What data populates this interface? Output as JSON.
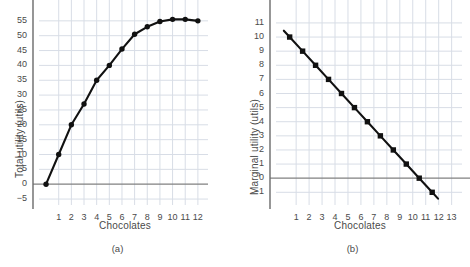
{
  "figure": {
    "panels": [
      {
        "caption": "(a)",
        "xlabel": "Chocolates",
        "ylabel": "Total utility (utils)"
      },
      {
        "caption": "(b)",
        "xlabel": "Chocolates",
        "ylabel": "Marginal utility (utils)"
      }
    ]
  },
  "chart_data": [
    {
      "type": "line",
      "title": "",
      "subtitle": "(a)",
      "xlabel": "Chocolates",
      "ylabel": "Total utility (utils)",
      "x": [
        0,
        1,
        2,
        3,
        4,
        5,
        6,
        7,
        8,
        9,
        10,
        11,
        12
      ],
      "values": [
        0,
        10,
        20,
        27,
        35,
        40,
        45.5,
        50.5,
        53,
        54.8,
        55.5,
        55.5,
        55
      ],
      "xlim": [
        -0.4,
        12.8
      ],
      "ylim": [
        -7,
        60
      ],
      "xticks": [
        1,
        2,
        3,
        4,
        5,
        6,
        7,
        8,
        9,
        10,
        11,
        12
      ],
      "xticklabels": [
        "1",
        "2",
        "3",
        "4",
        "5",
        "6",
        "7",
        "8",
        "9",
        "10",
        "11",
        "12"
      ],
      "yticks": [
        -5,
        0,
        5,
        10,
        15,
        20,
        25,
        30,
        35,
        40,
        45,
        50,
        55
      ],
      "yticklabels": [
        "−5",
        "0",
        "5",
        "10",
        "15",
        "20",
        "25",
        "30",
        "35",
        "40",
        "45",
        "50",
        "55"
      ],
      "grid": true,
      "legend": "none",
      "marker": "circle",
      "line_color": "#111111",
      "grid_color": "#d8dde6",
      "zero_line_color": "#808080"
    },
    {
      "type": "line",
      "title": "",
      "subtitle": "(b)",
      "xlabel": "Chocolates",
      "ylabel": "Marginal utility (utils)",
      "x": [
        0.5,
        1.5,
        2.5,
        3.5,
        4.5,
        5.5,
        6.5,
        7.5,
        8.5,
        9.5,
        10.5,
        11.5
      ],
      "values": [
        10,
        9,
        8,
        7,
        6,
        5,
        4,
        3,
        2,
        1,
        0,
        -1
      ],
      "xlim": [
        -0.4,
        13.8
      ],
      "ylim": [
        -1.9,
        12.2
      ],
      "xticks": [
        1,
        2,
        3,
        4,
        5,
        6,
        7,
        8,
        9,
        10,
        11,
        12,
        13
      ],
      "xticklabels": [
        "1",
        "2",
        "3",
        "4",
        "5",
        "6",
        "7",
        "8",
        "9",
        "10",
        "11",
        "12",
        "13"
      ],
      "yticks": [
        -1,
        0,
        1,
        2,
        3,
        4,
        5,
        6,
        7,
        8,
        9,
        10,
        11
      ],
      "yticklabels": [
        "−1",
        "0",
        "1",
        "2",
        "3",
        "4",
        "5",
        "6",
        "7",
        "8",
        "9",
        "10",
        "11"
      ],
      "grid": true,
      "legend": "none",
      "marker": "square",
      "line_color": "#111111",
      "grid_color": "#d8dde6",
      "zero_line_color": "#808080"
    }
  ]
}
